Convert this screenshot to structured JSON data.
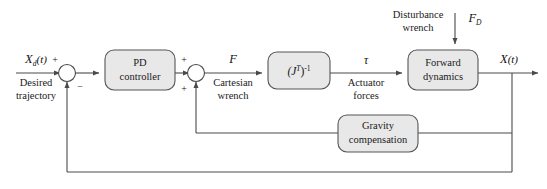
{
  "diagram": {
    "blocks": [
      {
        "id": "pd",
        "label_line1": "PD",
        "label_line2": "controller"
      },
      {
        "id": "jacobian",
        "label_line1": "(J",
        "label_sup": "T",
        "label_line2": ")",
        "label_exp": "-1"
      },
      {
        "id": "forward",
        "label_line1": "Forward",
        "label_line2": "dynamics"
      },
      {
        "id": "gravity",
        "label_line1": "Gravity",
        "label_line2": "compensation"
      }
    ],
    "signals": {
      "desired_symbol": "X",
      "desired_subscript": "d",
      "desired_arg": "(t)",
      "desired_caption_line1": "Desired",
      "desired_caption_line2": "trajectory",
      "cartesian_symbol": "F",
      "cartesian_caption_line1": "Cartesian",
      "cartesian_caption_line2": "wrench",
      "torque_symbol": "τ",
      "torque_caption_line1": "Actuator",
      "torque_caption_line2": "forces",
      "disturbance_symbol": "F",
      "disturbance_subscript": "D",
      "disturbance_caption_line1": "Disturbance",
      "disturbance_caption_line2": "wrench",
      "output_symbol": "X",
      "output_arg": "(t)"
    },
    "signs": {
      "sum1_top": "+",
      "sum1_bottom": "−",
      "sum2_top": "+",
      "sum2_bottom": "+"
    },
    "colors": {
      "block_fill": "#e8e8e8",
      "block_stroke": "#555555",
      "wire": "#4a4a4a",
      "text": "#1a1a1a",
      "background": "#ffffff"
    }
  }
}
